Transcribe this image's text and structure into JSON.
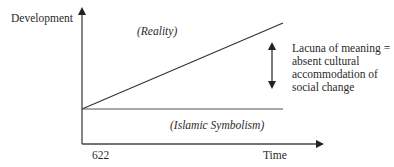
{
  "diagram": {
    "y_axis_label": "Development",
    "x_axis_label": "Time",
    "x_start_label": "622",
    "upper_line_label": "(Reality)",
    "lower_line_label": "(Islamic Symbolism)",
    "gap_annotation": {
      "lines": [
        "Lacuna of meaning =",
        "absent cultural",
        "accommodation of",
        "social change"
      ]
    },
    "colors": {
      "line": "#333333",
      "text": "#2a2a2a"
    }
  }
}
